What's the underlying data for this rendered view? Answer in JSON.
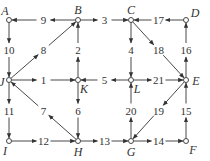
{
  "nodes": [
    {
      "id": "A",
      "label": "A",
      "x": 9,
      "y": 20,
      "lx": 5,
      "ly": 11
    },
    {
      "id": "B",
      "label": "B",
      "x": 78,
      "y": 20,
      "lx": 78,
      "ly": 10
    },
    {
      "id": "C",
      "label": "C",
      "x": 131,
      "y": 20,
      "lx": 131,
      "ly": 10
    },
    {
      "id": "D",
      "label": "D",
      "x": 186,
      "y": 20,
      "lx": 195,
      "ly": 13
    },
    {
      "id": "J",
      "label": "J",
      "x": 9,
      "y": 80,
      "lx": 2,
      "ly": 82
    },
    {
      "id": "K",
      "label": "K",
      "x": 78,
      "y": 80,
      "lx": 84,
      "ly": 89
    },
    {
      "id": "L",
      "label": "L",
      "x": 131,
      "y": 80,
      "lx": 137,
      "ly": 89
    },
    {
      "id": "E",
      "label": "E",
      "x": 186,
      "y": 80,
      "lx": 196,
      "ly": 81
    },
    {
      "id": "I",
      "label": "I",
      "x": 9,
      "y": 141,
      "lx": 5,
      "ly": 151
    },
    {
      "id": "H",
      "label": "H",
      "x": 78,
      "y": 141,
      "lx": 78,
      "ly": 152
    },
    {
      "id": "G",
      "label": "G",
      "x": 131,
      "y": 141,
      "lx": 131,
      "ly": 152
    },
    {
      "id": "F",
      "label": "F",
      "x": 186,
      "y": 141,
      "lx": 193,
      "ly": 150
    }
  ],
  "edges": [
    {
      "from": "B",
      "to": "A",
      "label": "9"
    },
    {
      "from": "B",
      "to": "C",
      "label": "3"
    },
    {
      "from": "D",
      "to": "C",
      "label": "17"
    },
    {
      "from": "A",
      "to": "J",
      "label": "10"
    },
    {
      "from": "J",
      "to": "B",
      "label": "8"
    },
    {
      "from": "K",
      "to": "B",
      "label": "2"
    },
    {
      "from": "C",
      "to": "L",
      "label": "4"
    },
    {
      "from": "C",
      "to": "E",
      "label": "18"
    },
    {
      "from": "E",
      "to": "D",
      "label": "16"
    },
    {
      "from": "J",
      "to": "K",
      "label": "1"
    },
    {
      "from": "L",
      "to": "K",
      "label": "5"
    },
    {
      "from": "L",
      "to": "E",
      "label": "21"
    },
    {
      "from": "J",
      "to": "I",
      "label": "11"
    },
    {
      "from": "H",
      "to": "J",
      "label": "7"
    },
    {
      "from": "K",
      "to": "H",
      "label": "6"
    },
    {
      "from": "G",
      "to": "L",
      "label": "20"
    },
    {
      "from": "E",
      "to": "G",
      "label": "19"
    },
    {
      "from": "F",
      "to": "E",
      "label": "15"
    },
    {
      "from": "I",
      "to": "H",
      "label": "12"
    },
    {
      "from": "H",
      "to": "G",
      "label": "13"
    },
    {
      "from": "G",
      "to": "F",
      "label": "14"
    }
  ]
}
